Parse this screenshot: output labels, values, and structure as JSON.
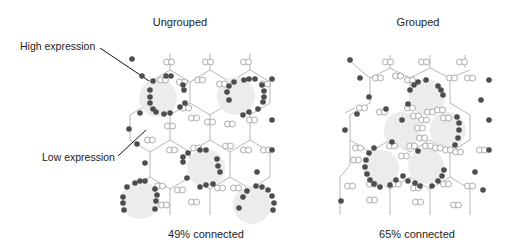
{
  "panels": [
    {
      "title": "Ungrouped",
      "caption": "49% connected"
    },
    {
      "title": "Grouped",
      "caption": "65% connected"
    }
  ],
  "annotations": {
    "high": "High expression",
    "low": "Low expression"
  },
  "colors": {
    "high_node": "#4d4d4d",
    "low_node_stroke": "#8a8a8a",
    "edge": "#9a9a9a",
    "cell_fill": "#ececec",
    "text": "#222222"
  }
}
